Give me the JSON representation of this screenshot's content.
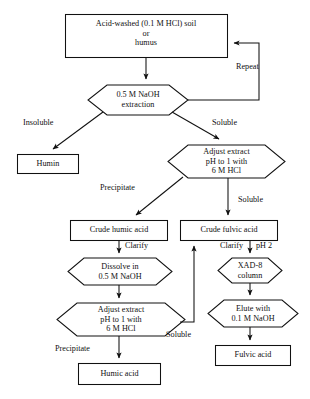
{
  "diagram": {
    "background_color": "#ffffff",
    "line_color": "#111111",
    "nodes": [
      {
        "id": "soil",
        "shape": "rect",
        "text": "Acid-washed (0.1 M HCl) soil\nor\nhumus"
      },
      {
        "id": "naoh_extraction",
        "shape": "hexagon",
        "text": "0.5 M NaOH\nextraction"
      },
      {
        "id": "humin",
        "shape": "rect",
        "text": "Humin"
      },
      {
        "id": "adjust_top",
        "shape": "hexagon",
        "text": "Adjust extract\npH to 1 with\n6 M HCl"
      },
      {
        "id": "crude_humic",
        "shape": "rect",
        "text": "Crude humic acid"
      },
      {
        "id": "crude_fulvic",
        "shape": "rect",
        "text": "Crude fulvic acid"
      },
      {
        "id": "dissolve",
        "shape": "hexagon",
        "text": "Dissolve in\n0.5 M NaOH"
      },
      {
        "id": "xad8",
        "shape": "hexagon",
        "text": "XAD-8\ncolumn"
      },
      {
        "id": "adjust_bottom",
        "shape": "hexagon",
        "text": "Adjust extract\npH to 1 with\n6 M HCl"
      },
      {
        "id": "elute",
        "shape": "hexagon",
        "text": "Elute with\n0.1 M NaOH"
      },
      {
        "id": "humic_acid",
        "shape": "rect",
        "text": "Humic acid"
      },
      {
        "id": "fulvic_acid",
        "shape": "rect",
        "text": "Fulvic acid"
      }
    ],
    "edge_labels": [
      {
        "id": "repeat",
        "text": "Repeat"
      },
      {
        "id": "insoluble",
        "text": "Insoluble"
      },
      {
        "id": "soluble_top",
        "text": "Soluble"
      },
      {
        "id": "precipitate_top",
        "text": "Precipitate"
      },
      {
        "id": "soluble_mid",
        "text": "Soluble"
      },
      {
        "id": "clarify_left",
        "text": "Clarify"
      },
      {
        "id": "clarify_right",
        "text": "Clarify"
      },
      {
        "id": "ph2",
        "text": "pH 2"
      },
      {
        "id": "soluble_bottom",
        "text": "Soluble"
      },
      {
        "id": "precipitate_bottom",
        "text": "Precipitate"
      }
    ]
  }
}
